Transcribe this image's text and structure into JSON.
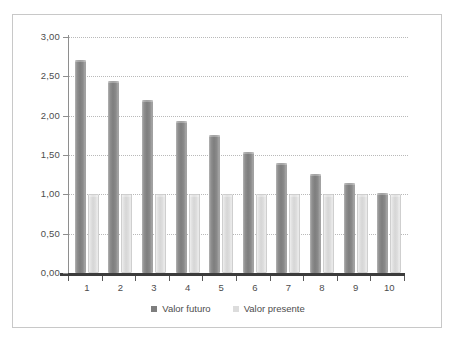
{
  "chart_data": {
    "type": "bar",
    "title": "",
    "xlabel": "",
    "ylabel": "",
    "categories": [
      "1",
      "2",
      "3",
      "4",
      "5",
      "6",
      "7",
      "8",
      "9",
      "10"
    ],
    "series": [
      {
        "name": "Valor futuro",
        "color": "#7e7e7e",
        "values": [
          2.71,
          2.44,
          2.2,
          1.93,
          1.75,
          1.54,
          1.4,
          1.26,
          1.15,
          1.02
        ]
      },
      {
        "name": "Valor presente",
        "color": "#dcdcdc",
        "values": [
          1.0,
          1.0,
          1.0,
          1.0,
          1.0,
          1.0,
          1.0,
          1.0,
          1.0,
          1.0
        ]
      }
    ],
    "ylim": [
      0,
      3.0
    ],
    "ytick_values": [
      3.0,
      2.5,
      2.0,
      1.5,
      1.0,
      0.5,
      0.0
    ],
    "ytick_labels": [
      "3,00",
      "2,50",
      "2,00",
      "1,50",
      "1,00",
      "0,50",
      "0,00"
    ],
    "grid": true,
    "grid_axis": "y",
    "grid_style": "dotted",
    "legend_position": "bottom",
    "legend": [
      "Valor futuro",
      "Valor presente"
    ]
  },
  "axis": {
    "y_labels": [
      "3,00",
      "2,50",
      "2,00",
      "1,50",
      "1,00",
      "0,50",
      "0,00"
    ],
    "x_labels": [
      "1",
      "2",
      "3",
      "4",
      "5",
      "6",
      "7",
      "8",
      "9",
      "10"
    ]
  },
  "legend": {
    "items": [
      {
        "label": "Valor futuro",
        "color": "#7e7e7e"
      },
      {
        "label": "Valor presente",
        "color": "#dcdcdc"
      }
    ]
  },
  "colors": {
    "series_futuro": "#7e7e7e",
    "series_presente": "#dcdcdc",
    "grid": "#b9b9b9",
    "axis": "#3c3c3c",
    "frame": "#c8c8c8",
    "text": "#4d4d4d",
    "background": "#ffffff"
  }
}
